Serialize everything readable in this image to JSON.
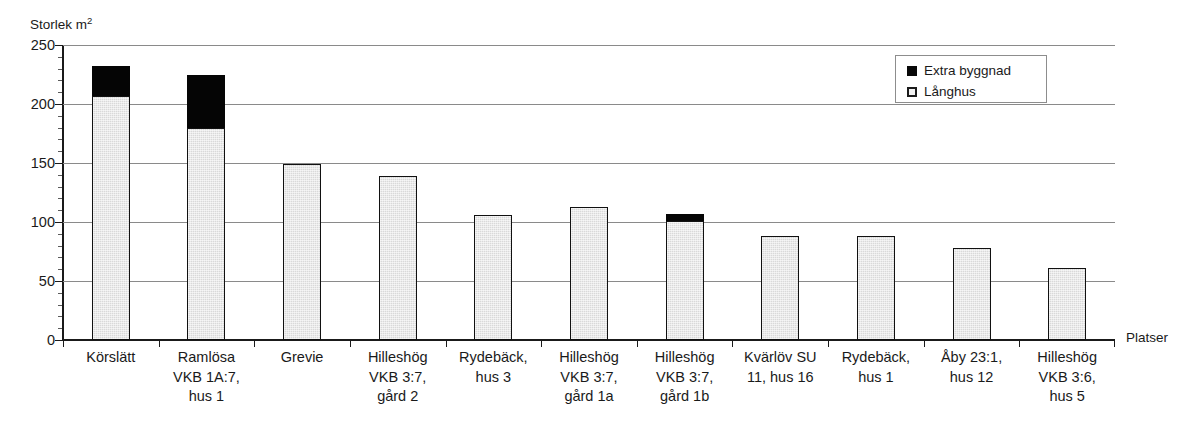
{
  "chart_data": {
    "type": "bar",
    "title": "",
    "subtitle": "",
    "ylabel": "Storlek m",
    "ylabel_sup": "2",
    "xlabel": "Platser",
    "ylim": [
      0,
      250
    ],
    "yticks": [
      0,
      50,
      100,
      150,
      200,
      250
    ],
    "ytick_labels": [
      "0",
      "50",
      "100",
      "150",
      "200",
      "250"
    ],
    "minor_tick_step": 10,
    "grid": true,
    "grid_axis": "y",
    "stacked": true,
    "legend_position": "top-right",
    "categories": [
      "Körslätt",
      "Ramlösa VKB 1A:7, hus 1",
      "Grevie",
      "Hilleshög VKB 3:7, gård 2",
      "Rydebäck, hus 3",
      "Hilleshög VKB 3:7, gård 1a",
      "Hilleshög VKB 3:7, gård 1b",
      "Kvärlöv SU 11, hus 16",
      "Rydebäck, hus 1",
      "Åby 23:1, hus 12",
      "Hilleshög VKB 3:6, hus 5"
    ],
    "category_lines": [
      [
        "Körslätt"
      ],
      [
        "Ramlösa",
        "VKB 1A:7,",
        "hus 1"
      ],
      [
        "Grevie"
      ],
      [
        "Hilleshög",
        "VKB 3:7,",
        "gård 2"
      ],
      [
        "Rydebäck,",
        "hus 3"
      ],
      [
        "Hilleshög",
        "VKB 3:7,",
        "gård 1a"
      ],
      [
        "Hilleshög",
        "VKB 3:7,",
        "gård 1b"
      ],
      [
        "Kvärlöv SU",
        "11, hus 16"
      ],
      [
        "Rydebäck,",
        "hus 1"
      ],
      [
        "Åby 23:1,",
        "hus 12"
      ],
      [
        "Hilleshög",
        "VKB 3:6,",
        "hus 5"
      ]
    ],
    "series": [
      {
        "name": "Långhus",
        "color": "#d9d9d9",
        "values": [
          207,
          180,
          149,
          139,
          106,
          113,
          101,
          88,
          88,
          78,
          61
        ]
      },
      {
        "name": "Extra byggnad",
        "color": "#080808",
        "values": [
          25,
          45,
          0,
          0,
          0,
          0,
          6,
          0,
          0,
          0,
          0
        ]
      }
    ],
    "totals": [
      232,
      225,
      149,
      139,
      106,
      113,
      107,
      88,
      88,
      78,
      61
    ],
    "legend": [
      {
        "label": "Extra byggnad",
        "color": "#080808",
        "style": "filled"
      },
      {
        "label": "Långhus",
        "color": "#f2f2f2",
        "style": "outlined"
      }
    ]
  }
}
